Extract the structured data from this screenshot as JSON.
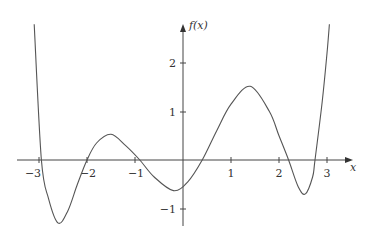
{
  "chart_data": {
    "type": "line",
    "title": "",
    "xlabel": "x",
    "ylabel": "f(x)",
    "xlim": [
      -3.2,
      3.5
    ],
    "ylim": [
      -1.35,
      2.8
    ],
    "grid": false,
    "legend": null,
    "x_ticks": [
      -3,
      -2,
      -1,
      1,
      2,
      3
    ],
    "x_tick_labels": [
      "−3",
      "−2",
      "−1",
      "1",
      "2",
      "3"
    ],
    "y_ticks": [
      2,
      1,
      -1
    ],
    "y_tick_labels": [
      "2",
      "1",
      "−1"
    ],
    "series": [
      {
        "name": "f(x)",
        "x": [
          -3.1,
          -2.95,
          -2.8,
          -2.6,
          -2.4,
          -2.2,
          -2.0,
          -1.8,
          -1.5,
          -1.2,
          -0.9,
          -0.6,
          -0.2,
          0.1,
          0.4,
          0.7,
          1.0,
          1.4,
          1.8,
          2.0,
          2.2,
          2.4,
          2.55,
          2.7,
          2.75,
          2.9,
          3.0,
          3.05
        ],
        "values": [
          2.8,
          0.0,
          -0.8,
          -1.3,
          -1.05,
          -0.5,
          0.0,
          0.35,
          0.53,
          0.3,
          0.0,
          -0.35,
          -0.63,
          -0.45,
          0.0,
          0.6,
          1.15,
          1.52,
          1.0,
          0.5,
          0.0,
          -0.55,
          -0.7,
          -0.35,
          0.0,
          1.2,
          2.2,
          2.8
        ]
      }
    ],
    "zeros": [
      -2.95,
      -2.0,
      -0.9,
      0.4,
      2.2,
      2.75
    ],
    "extrema": [
      {
        "x": -2.6,
        "y": -1.3,
        "kind": "min"
      },
      {
        "x": -1.5,
        "y": 0.53,
        "kind": "max"
      },
      {
        "x": -0.2,
        "y": -0.63,
        "kind": "min"
      },
      {
        "x": 1.4,
        "y": 1.52,
        "kind": "max"
      },
      {
        "x": 2.55,
        "y": -0.7,
        "kind": "min"
      }
    ]
  },
  "labels": {
    "x_axis": "x",
    "y_axis": "f(x)",
    "xt_m3": "−3",
    "xt_m2": "−2",
    "xt_m1": "−1",
    "xt_1": "1",
    "xt_2": "2",
    "xt_3": "3",
    "yt_2": "2",
    "yt_1": "1",
    "yt_m1": "−1"
  },
  "colors": {
    "axis": "#333333",
    "curve": "#555555",
    "background": "#ffffff"
  }
}
